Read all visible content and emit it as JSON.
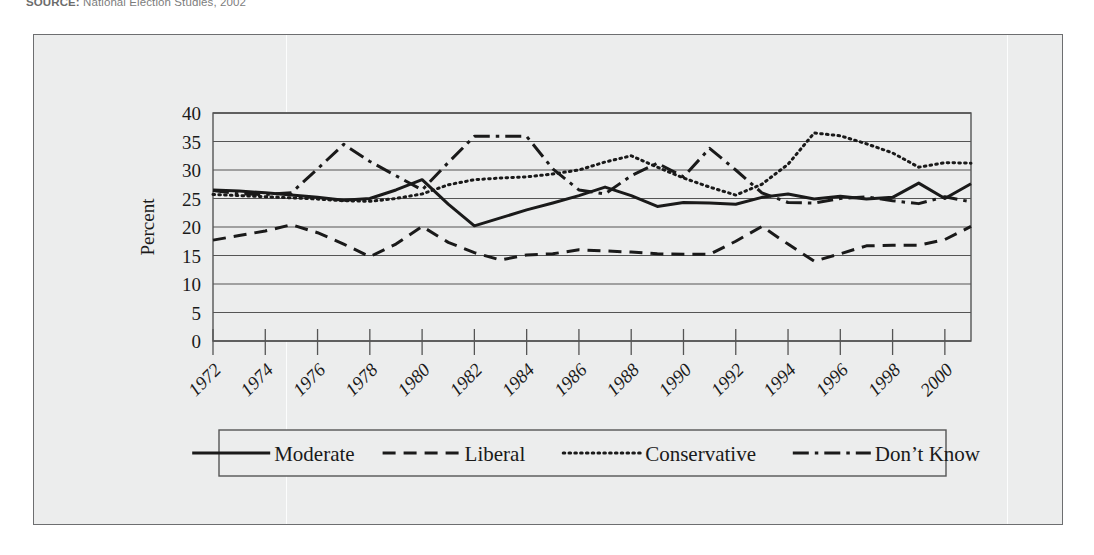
{
  "source_note": {
    "prefix": "SOURCE:",
    "text": "National Election Studies, 2002"
  },
  "axis": {
    "ylabel": "Percent",
    "ytick_labels": [
      "0",
      "5",
      "10",
      "15",
      "20",
      "25",
      "30",
      "35",
      "40"
    ],
    "xtick_labels": [
      "1972",
      "1974",
      "1976",
      "1978",
      "1980",
      "1982",
      "1984",
      "1986",
      "1988",
      "1990",
      "1992",
      "1994",
      "1996",
      "1998",
      "2000"
    ]
  },
  "legend": {
    "items": [
      {
        "label": "Moderate",
        "style": "solid"
      },
      {
        "label": "Liberal",
        "style": "dashed"
      },
      {
        "label": "Conservative",
        "style": "dotted"
      },
      {
        "label": "Don’t Know",
        "style": "dashdot"
      }
    ]
  },
  "colors": {
    "ink": "#1a1a1a",
    "grid": "#555555",
    "panel": "#eceded",
    "frame": "#6d6e70"
  },
  "chart_data": {
    "type": "line",
    "title": "",
    "xlabel": "",
    "ylabel": "Percent",
    "ylim": [
      0,
      40
    ],
    "ytick_interval": 5,
    "grid": true,
    "legend_position": "bottom",
    "x": [
      1972,
      1973,
      1974,
      1975,
      1976,
      1977,
      1978,
      1979,
      1980,
      1981,
      1982,
      1983,
      1984,
      1985,
      1986,
      1987,
      1988,
      1989,
      1990,
      1991,
      1992,
      1993,
      1994,
      1995,
      1996,
      1997,
      1998,
      1999,
      2000,
      2001
    ],
    "xtick_labels": [
      "1972",
      "1974",
      "1976",
      "1978",
      "1980",
      "1982",
      "1984",
      "1986",
      "1988",
      "1990",
      "1992",
      "1994",
      "1996",
      "1998",
      "2000"
    ],
    "series": [
      {
        "name": "Moderate",
        "style": "solid",
        "values": [
          26.5,
          26.3,
          26.0,
          25.6,
          25.2,
          24.7,
          25.0,
          26.5,
          28.3,
          24.0,
          20.2,
          21.6,
          23.0,
          24.2,
          25.5,
          27.0,
          25.5,
          23.6,
          24.3,
          24.2,
          24.0,
          25.2,
          25.8,
          24.9,
          25.4,
          24.9,
          25.2,
          27.7,
          25.0,
          27.6
        ]
      },
      {
        "name": "Liberal",
        "style": "dashed",
        "values": [
          17.7,
          18.5,
          19.3,
          20.4,
          19.0,
          17.0,
          14.8,
          17.0,
          20.1,
          17.3,
          15.5,
          14.2,
          15.1,
          15.3,
          16.0,
          15.8,
          15.6,
          15.3,
          15.2,
          15.2,
          17.5,
          20.1,
          17.0,
          14.0,
          15.3,
          16.7,
          16.8,
          16.8,
          17.8,
          20.1
        ]
      },
      {
        "name": "Conservative",
        "style": "dotted",
        "values": [
          25.7,
          25.5,
          25.3,
          25.1,
          24.9,
          24.6,
          24.5,
          25.0,
          25.8,
          27.4,
          28.3,
          28.6,
          28.8,
          29.3,
          30.0,
          31.4,
          32.5,
          30.5,
          28.6,
          27.0,
          25.6,
          27.5,
          31.0,
          36.5,
          36.0,
          34.6,
          33.0,
          30.5,
          31.3,
          31.2
        ]
      },
      {
        "name": "Don’t Know",
        "style": "dashdot",
        "values": [
          26.4,
          25.8,
          25.7,
          26.0,
          30.2,
          34.5,
          31.5,
          29.0,
          26.5,
          31.3,
          35.9,
          35.9,
          35.9,
          30.2,
          26.5,
          25.8,
          29.0,
          31.2,
          28.8,
          33.8,
          30.0,
          26.0,
          24.3,
          24.2,
          25.0,
          25.3,
          24.6,
          24.1,
          25.3,
          24.4
        ]
      }
    ]
  }
}
